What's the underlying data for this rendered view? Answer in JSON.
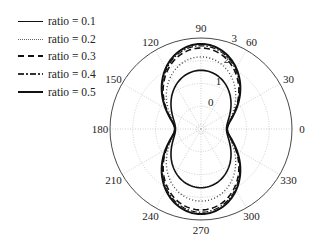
{
  "chart_data": {
    "type": "polar-line",
    "title": "",
    "angular_axis": {
      "unit": "degrees",
      "ticks": [
        0,
        30,
        60,
        90,
        120,
        150,
        180,
        210,
        240,
        270,
        300,
        330
      ],
      "tick_labels": [
        "0",
        "30",
        "60",
        "90",
        "120",
        "150",
        "180",
        "210",
        "240",
        "270",
        "300",
        "330"
      ]
    },
    "radial_axis": {
      "range": [
        -1,
        3
      ],
      "ticks": [
        0,
        1,
        2,
        3
      ],
      "tick_labels": [
        "0",
        "1",
        "2",
        "3"
      ],
      "label_angle_deg": 70
    },
    "grid": true,
    "legend_position": "upper-left-outside",
    "model": "r(theta) = r_min + (r_max - r_min) * sin^2(theta)",
    "series": [
      {
        "name": "ratio = 0.1",
        "style": "solid",
        "width": 1.6,
        "r_min": 0.12,
        "r_max": 1.58,
        "samples": {
          "theta": [
            0,
            30,
            60,
            90,
            120,
            150,
            180,
            210,
            240,
            270,
            300,
            330
          ],
          "r": [
            0.12,
            0.49,
            1.22,
            1.58,
            1.22,
            0.49,
            0.12,
            0.49,
            1.22,
            1.58,
            1.22,
            0.49
          ]
        }
      },
      {
        "name": "ratio = 0.2",
        "style": "dotted",
        "width": 1.4,
        "r_min": 0.14,
        "r_max": 2.17,
        "samples": {
          "theta": [
            0,
            30,
            60,
            90,
            120,
            150,
            180,
            210,
            240,
            270,
            300,
            330
          ],
          "r": [
            0.14,
            0.65,
            1.66,
            2.17,
            1.66,
            0.65,
            0.14,
            0.65,
            1.66,
            2.17,
            1.66,
            0.65
          ]
        }
      },
      {
        "name": "ratio = 0.3",
        "style": "dashed",
        "width": 1.6,
        "r_min": 0.15,
        "r_max": 2.56,
        "samples": {
          "theta": [
            0,
            30,
            60,
            90,
            120,
            150,
            180,
            210,
            240,
            270,
            300,
            330
          ],
          "r": [
            0.15,
            0.75,
            1.96,
            2.56,
            1.96,
            0.75,
            0.15,
            0.75,
            1.96,
            2.56,
            1.96,
            0.75
          ]
        }
      },
      {
        "name": "ratio = 0.4",
        "style": "dashdot",
        "width": 1.2,
        "r_min": 0.15,
        "r_max": 2.66,
        "samples": {
          "theta": [
            0,
            30,
            60,
            90,
            120,
            150,
            180,
            210,
            240,
            270,
            300,
            330
          ],
          "r": [
            0.15,
            0.78,
            2.03,
            2.66,
            2.03,
            0.78,
            0.15,
            0.78,
            2.03,
            2.66,
            2.03,
            0.78
          ]
        }
      },
      {
        "name": "ratio = 0.5",
        "style": "solid",
        "width": 2.0,
        "r_min": 0.15,
        "r_max": 2.74,
        "samples": {
          "theta": [
            0,
            30,
            60,
            90,
            120,
            150,
            180,
            210,
            240,
            270,
            300,
            330
          ],
          "r": [
            0.15,
            0.8,
            2.09,
            2.74,
            2.09,
            0.8,
            0.15,
            0.8,
            2.09,
            2.74,
            2.09,
            0.8
          ]
        }
      }
    ],
    "colors": {
      "line": "#111111",
      "grid": "#bbbbbb",
      "frame": "#333333",
      "text": "#222222"
    }
  },
  "legend": {
    "items": [
      {
        "label": "ratio = 0.1"
      },
      {
        "label": "ratio = 0.2"
      },
      {
        "label": "ratio = 0.3"
      },
      {
        "label": "ratio = 0.4"
      },
      {
        "label": "ratio = 0.5"
      }
    ]
  }
}
